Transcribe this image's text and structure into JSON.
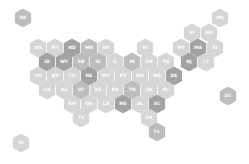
{
  "map": {
    "type": "us-state-hexbin",
    "palette": {
      "dark": "#a3a3a3",
      "mid": "#bdbdbd",
      "light": "#d6d6d6",
      "label": "#ffffff"
    },
    "states": [
      {
        "abbr": "AK",
        "x": 23,
        "y": 18,
        "shade": "mid"
      },
      {
        "abbr": "ME",
        "x": 220,
        "y": 18,
        "shade": "light"
      },
      {
        "abbr": "VT",
        "x": 192,
        "y": 33,
        "shade": "light"
      },
      {
        "abbr": "NH",
        "x": 209,
        "y": 33,
        "shade": "light"
      },
      {
        "abbr": "WA",
        "x": 38,
        "y": 48,
        "shade": "light"
      },
      {
        "abbr": "MT",
        "x": 55,
        "y": 48,
        "shade": "light"
      },
      {
        "abbr": "ND",
        "x": 72,
        "y": 48,
        "shade": "dark"
      },
      {
        "abbr": "MN",
        "x": 89,
        "y": 48,
        "shade": "mid"
      },
      {
        "abbr": "WI",
        "x": 106,
        "y": 48,
        "shade": "light"
      },
      {
        "abbr": "MI",
        "x": 145,
        "y": 48,
        "shade": "light"
      },
      {
        "abbr": "NY",
        "x": 181,
        "y": 48,
        "shade": "light"
      },
      {
        "abbr": "MA",
        "x": 198,
        "y": 48,
        "shade": "dark"
      },
      {
        "abbr": "RI",
        "x": 215,
        "y": 48,
        "shade": "light"
      },
      {
        "abbr": "ID",
        "x": 47,
        "y": 62,
        "shade": "dark"
      },
      {
        "abbr": "WY",
        "x": 64,
        "y": 62,
        "shade": "dark"
      },
      {
        "abbr": "SD",
        "x": 81,
        "y": 62,
        "shade": "mid"
      },
      {
        "abbr": "IA",
        "x": 98,
        "y": 62,
        "shade": "mid"
      },
      {
        "abbr": "IL",
        "x": 115,
        "y": 62,
        "shade": "light"
      },
      {
        "abbr": "IN",
        "x": 132,
        "y": 62,
        "shade": "mid"
      },
      {
        "abbr": "OH",
        "x": 149,
        "y": 62,
        "shade": "light"
      },
      {
        "abbr": "PA",
        "x": 166,
        "y": 62,
        "shade": "light"
      },
      {
        "abbr": "NJ",
        "x": 189,
        "y": 62,
        "shade": "dark"
      },
      {
        "abbr": "CT",
        "x": 206,
        "y": 62,
        "shade": "light"
      },
      {
        "abbr": "OR",
        "x": 38,
        "y": 76,
        "shade": "light"
      },
      {
        "abbr": "NV",
        "x": 55,
        "y": 76,
        "shade": "light"
      },
      {
        "abbr": "CO",
        "x": 72,
        "y": 76,
        "shade": "light"
      },
      {
        "abbr": "NE",
        "x": 89,
        "y": 76,
        "shade": "dark"
      },
      {
        "abbr": "MO",
        "x": 106,
        "y": 76,
        "shade": "light"
      },
      {
        "abbr": "KY",
        "x": 123,
        "y": 76,
        "shade": "light"
      },
      {
        "abbr": "WV",
        "x": 140,
        "y": 76,
        "shade": "light"
      },
      {
        "abbr": "MD",
        "x": 157,
        "y": 76,
        "shade": "light"
      },
      {
        "abbr": "DE",
        "x": 174,
        "y": 76,
        "shade": "dark"
      },
      {
        "abbr": "CA",
        "x": 47,
        "y": 90,
        "shade": "light"
      },
      {
        "abbr": "AZ",
        "x": 64,
        "y": 90,
        "shade": "light"
      },
      {
        "abbr": "UT",
        "x": 81,
        "y": 90,
        "shade": "mid"
      },
      {
        "abbr": "KS",
        "x": 98,
        "y": 90,
        "shade": "light"
      },
      {
        "abbr": "AR",
        "x": 115,
        "y": 90,
        "shade": "light"
      },
      {
        "abbr": "TN",
        "x": 132,
        "y": 90,
        "shade": "mid"
      },
      {
        "abbr": "VA",
        "x": 149,
        "y": 90,
        "shade": "light"
      },
      {
        "abbr": "NC",
        "x": 166,
        "y": 90,
        "shade": "light"
      },
      {
        "abbr": "DC",
        "x": 228,
        "y": 96,
        "shade": "mid"
      },
      {
        "abbr": "NM",
        "x": 72,
        "y": 104,
        "shade": "light"
      },
      {
        "abbr": "OK",
        "x": 89,
        "y": 104,
        "shade": "light"
      },
      {
        "abbr": "LA",
        "x": 106,
        "y": 104,
        "shade": "light"
      },
      {
        "abbr": "MS",
        "x": 123,
        "y": 104,
        "shade": "dark"
      },
      {
        "abbr": "AL",
        "x": 140,
        "y": 104,
        "shade": "light"
      },
      {
        "abbr": "SC",
        "x": 157,
        "y": 104,
        "shade": "dark"
      },
      {
        "abbr": "TX",
        "x": 81,
        "y": 118,
        "shade": "light"
      },
      {
        "abbr": "GA",
        "x": 149,
        "y": 118,
        "shade": "light"
      },
      {
        "abbr": "FL",
        "x": 157,
        "y": 132,
        "shade": "mid"
      },
      {
        "abbr": "HI",
        "x": 21,
        "y": 143,
        "shade": "light"
      }
    ]
  }
}
